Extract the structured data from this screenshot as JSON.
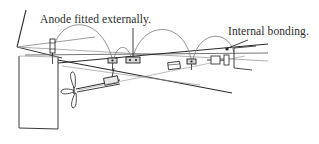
{
  "figure": {
    "type": "technical-line-diagram",
    "background_color": "#ffffff",
    "line_color_dark": "#262626",
    "line_color_light": "#9a9a9a",
    "line_color_mid": "#6e6e6e",
    "text_color": "#2b2b2b"
  },
  "annotations": [
    {
      "id": "anode",
      "text": "Anode fitted externally.",
      "x": 40,
      "y": 14,
      "leader": "vertical line descending to centre anode block"
    },
    {
      "id": "bonding",
      "text": "Internal bonding.",
      "x": 228,
      "y": 26,
      "leader": "diagonal line descending left to bonding terminal dot"
    }
  ],
  "components": {
    "transom": "vertical stern panel at left",
    "stem_line": "diagonal line rising from transom top-left",
    "hull_sheer_line": "long shallow diagonal running left to right",
    "waterline": "second parallel diagonal below sheer",
    "propeller": "three-blade propeller on shaft at lower left",
    "shaft_line": "long diagonal crossing hull lines",
    "anode_blocks": 4,
    "bonding_arcs": 4,
    "shaft_couplings": 2
  }
}
